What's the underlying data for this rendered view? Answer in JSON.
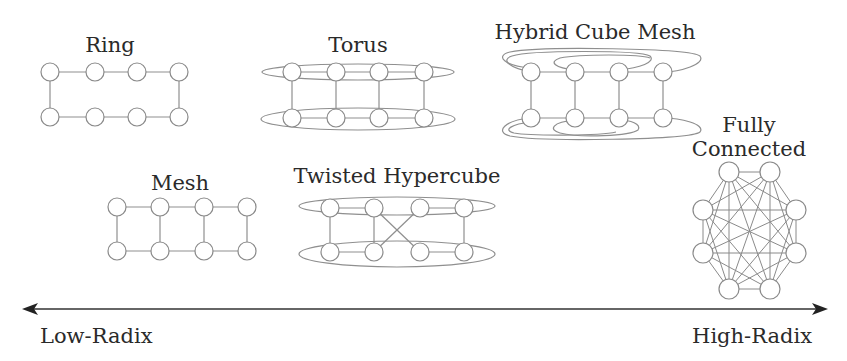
{
  "diagram": {
    "topologies": [
      {
        "id": "ring",
        "label": "Ring"
      },
      {
        "id": "torus",
        "label": "Torus"
      },
      {
        "id": "hybrid-cube-mesh",
        "label": "Hybrid Cube Mesh"
      },
      {
        "id": "fully-connected",
        "label_line1": "Fully",
        "label_line2": "Connected"
      },
      {
        "id": "mesh",
        "label": "Mesh"
      },
      {
        "id": "twisted-hypercube",
        "label": "Twisted Hypercube"
      }
    ],
    "axis": {
      "low_label": "Low-Radix",
      "high_label": "High-Radix"
    },
    "colors": {
      "node_stroke": "#8a8a8a",
      "edge": "#8f8f8f",
      "text": "#2a2a2a",
      "axis": "#333333"
    }
  }
}
